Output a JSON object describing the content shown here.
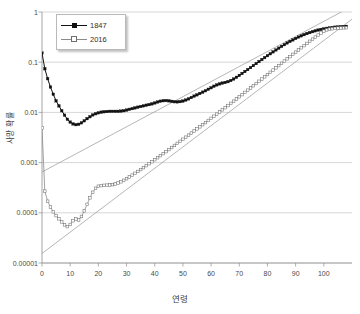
{
  "chart_data": {
    "type": "line",
    "title": "",
    "xlabel": "연령",
    "ylabel": "사망 확률",
    "xlim": [
      0,
      110
    ],
    "ylim": [
      1e-05,
      1
    ],
    "yscale": "log",
    "grid": "horizontal",
    "legend_position": "top-left",
    "x_ticks": [
      0,
      10,
      20,
      30,
      40,
      50,
      60,
      70,
      80,
      90,
      100
    ],
    "x_tick_labels": [
      "0",
      "10",
      "20",
      "30",
      "40",
      "50",
      "60",
      "70",
      "80",
      "90",
      "100"
    ],
    "y_ticks": [
      1,
      0.1,
      0.01,
      0.001,
      0.0001,
      1e-05
    ],
    "y_tick_labels": [
      "1",
      "0.1",
      "0.01",
      "0.001",
      "0.0001",
      "0.00001"
    ],
    "series": [
      {
        "name": "1847",
        "marker": "filled-square",
        "color": "#111111",
        "x": [
          0,
          1,
          2,
          3,
          4,
          5,
          6,
          7,
          8,
          9,
          10,
          11,
          12,
          13,
          14,
          15,
          16,
          17,
          18,
          19,
          20,
          21,
          22,
          23,
          24,
          25,
          26,
          27,
          28,
          29,
          30,
          31,
          32,
          33,
          34,
          35,
          36,
          37,
          38,
          39,
          40,
          41,
          42,
          43,
          44,
          45,
          46,
          47,
          48,
          49,
          50,
          51,
          52,
          53,
          54,
          55,
          56,
          57,
          58,
          59,
          60,
          61,
          62,
          63,
          64,
          65,
          66,
          67,
          68,
          69,
          70,
          71,
          72,
          73,
          74,
          75,
          76,
          77,
          78,
          79,
          80,
          81,
          82,
          83,
          84,
          85,
          86,
          87,
          88,
          89,
          90,
          91,
          92,
          93,
          94,
          95,
          96,
          97,
          98,
          99,
          100,
          101,
          102,
          103,
          104,
          105,
          106,
          107,
          108
        ],
        "values": [
          0.152,
          0.074,
          0.047,
          0.032,
          0.023,
          0.017,
          0.0135,
          0.0108,
          0.0088,
          0.0073,
          0.0064,
          0.0059,
          0.0057,
          0.0058,
          0.0062,
          0.0068,
          0.0075,
          0.0082,
          0.0089,
          0.0094,
          0.0098,
          0.0101,
          0.0103,
          0.0104,
          0.0105,
          0.0105,
          0.0105,
          0.0105,
          0.0106,
          0.0108,
          0.0111,
          0.0115,
          0.0119,
          0.0123,
          0.0127,
          0.0131,
          0.0135,
          0.0139,
          0.0143,
          0.0148,
          0.0154,
          0.0161,
          0.0167,
          0.0171,
          0.0172,
          0.017,
          0.0166,
          0.0163,
          0.0162,
          0.0164,
          0.0168,
          0.0176,
          0.0186,
          0.0198,
          0.0211,
          0.0224,
          0.0238,
          0.0253,
          0.027,
          0.0289,
          0.031,
          0.0332,
          0.0353,
          0.037,
          0.0383,
          0.0395,
          0.041,
          0.0432,
          0.0462,
          0.05,
          0.0545,
          0.0596,
          0.0652,
          0.0714,
          0.0782,
          0.0857,
          0.094,
          0.103,
          0.1128,
          0.1235,
          0.135,
          0.1474,
          0.1607,
          0.175,
          0.1903,
          0.2065,
          0.2235,
          0.2412,
          0.2595,
          0.2782,
          0.2972,
          0.3163,
          0.3353,
          0.354,
          0.3722,
          0.3897,
          0.4063,
          0.4219,
          0.4364,
          0.4497,
          0.4618,
          0.4726,
          0.4822,
          0.4906,
          0.4979,
          0.5042,
          0.5095,
          0.514,
          0.5178
        ]
      },
      {
        "name": "2016",
        "marker": "open-square",
        "color": "#8a8a8a",
        "x": [
          0,
          1,
          2,
          3,
          4,
          5,
          6,
          7,
          8,
          9,
          10,
          11,
          12,
          13,
          14,
          15,
          16,
          17,
          18,
          19,
          20,
          21,
          22,
          23,
          24,
          25,
          26,
          27,
          28,
          29,
          30,
          31,
          32,
          33,
          34,
          35,
          36,
          37,
          38,
          39,
          40,
          41,
          42,
          43,
          44,
          45,
          46,
          47,
          48,
          49,
          50,
          51,
          52,
          53,
          54,
          55,
          56,
          57,
          58,
          59,
          60,
          61,
          62,
          63,
          64,
          65,
          66,
          67,
          68,
          69,
          70,
          71,
          72,
          73,
          74,
          75,
          76,
          77,
          78,
          79,
          80,
          81,
          82,
          83,
          84,
          85,
          86,
          87,
          88,
          89,
          90,
          91,
          92,
          93,
          94,
          95,
          96,
          97,
          98,
          99,
          100,
          101,
          102,
          103,
          104,
          105,
          106,
          107,
          108
        ],
        "values": [
          0.0049,
          0.00027,
          0.00017,
          0.00013,
          0.000105,
          8.8e-05,
          7.6e-05,
          6.6e-05,
          5.75e-05,
          5.3e-05,
          5.85e-05,
          6.95e-05,
          7.55e-05,
          7.2e-05,
          8.45e-05,
          0.0001095,
          0.000147,
          0.000199,
          0.000256,
          0.000308,
          0.000338,
          0.000348,
          0.000352,
          0.000355,
          0.000358,
          0.000364,
          0.000375,
          0.000392,
          0.000415,
          0.000444,
          0.000478,
          0.000517,
          0.000561,
          0.000611,
          0.000666,
          0.000727,
          0.000794,
          0.000869,
          0.000951,
          0.001042,
          0.001143,
          0.001253,
          0.001375,
          0.001509,
          0.001657,
          0.001819,
          0.001998,
          0.002195,
          0.002412,
          0.002651,
          0.002914,
          0.003204,
          0.003524,
          0.003877,
          0.004266,
          0.004695,
          0.005168,
          0.00569,
          0.006266,
          0.006903,
          0.007606,
          0.008383,
          0.009243,
          0.010194,
          0.011247,
          0.012413,
          0.013705,
          0.015137,
          0.016725,
          0.018486,
          0.02044,
          0.022609,
          0.025016,
          0.027689,
          0.030657,
          0.033953,
          0.037613,
          0.041678,
          0.046191,
          0.051201,
          0.056761,
          0.062929,
          0.06977,
          0.077353,
          0.085755,
          0.095058,
          0.105353,
          0.116738,
          0.129318,
          0.143206,
          0.15852,
          0.175384,
          0.193925,
          0.214271,
          0.236548,
          0.260876,
          0.287358,
          0.316075,
          0.347073,
          0.38035,
          0.41584,
          0.44,
          0.455,
          0.465,
          0.472,
          0.477,
          0.481,
          0.484,
          0.487
        ]
      }
    ],
    "trend_lines": [
      {
        "name": "gompertz-1847",
        "x": [
          0,
          110
        ],
        "y": [
          0.00065,
          1.3
        ]
      },
      {
        "name": "gompertz-2016",
        "x": [
          0,
          110
        ],
        "y": [
          1.55e-05,
          0.72
        ]
      }
    ]
  },
  "legend": {
    "items": [
      {
        "label": "1847"
      },
      {
        "label": "2016"
      }
    ]
  },
  "axes": {
    "x_title": "연령",
    "y_title": "사망 확률"
  }
}
